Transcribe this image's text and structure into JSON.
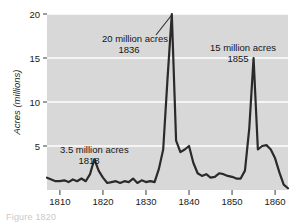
{
  "figure": {
    "background_color": "#ffffff",
    "plot_background_color": "#d8d8d8",
    "gridline_color": "#ffffff",
    "line_color": "#2a2a2a",
    "text_color": "#141414",
    "caption_fragment": "Figure    1820"
  },
  "chart_data": {
    "type": "line",
    "title": "",
    "subtitle": "",
    "xlabel": "",
    "ylabel": "Acres (millions)",
    "xlim": [
      1807,
      1863
    ],
    "ylim": [
      0,
      20
    ],
    "xticks": [
      1810,
      1820,
      1830,
      1840,
      1850,
      1860
    ],
    "yticks": [
      5,
      10,
      15,
      20
    ],
    "xtick_labels": [
      "1810",
      "1820",
      "1830",
      "1840",
      "1850",
      "1860"
    ],
    "ytick_labels": [
      "5",
      "10",
      "15",
      "20"
    ],
    "grid": true,
    "grid_axis": "y",
    "legend": false,
    "legend_position": "none",
    "series": [
      {
        "name": "Public land sales",
        "x": [
          1807,
          1808,
          1809,
          1810,
          1811,
          1812,
          1813,
          1814,
          1815,
          1816,
          1817,
          1818,
          1819,
          1820,
          1821,
          1822,
          1823,
          1824,
          1825,
          1826,
          1827,
          1828,
          1829,
          1830,
          1831,
          1832,
          1833,
          1834,
          1835,
          1836,
          1837,
          1838,
          1839,
          1840,
          1841,
          1842,
          1843,
          1844,
          1845,
          1846,
          1847,
          1848,
          1849,
          1850,
          1851,
          1852,
          1853,
          1854,
          1855,
          1856,
          1857,
          1858,
          1859,
          1860,
          1861,
          1862,
          1863
        ],
        "values": [
          1.4,
          1.2,
          1.0,
          1.0,
          1.1,
          0.9,
          1.2,
          1.0,
          1.3,
          1.0,
          1.8,
          3.5,
          2.2,
          1.4,
          0.8,
          0.9,
          1.0,
          0.8,
          1.0,
          0.9,
          1.3,
          0.8,
          1.1,
          0.9,
          1.0,
          0.9,
          2.4,
          4.6,
          12.6,
          20.0,
          5.6,
          4.3,
          4.6,
          5.0,
          3.1,
          1.9,
          1.6,
          1.8,
          1.4,
          1.5,
          1.9,
          1.8,
          1.6,
          1.5,
          1.3,
          1.3,
          2.2,
          7.0,
          15.0,
          4.6,
          5.0,
          5.1,
          4.6,
          3.6,
          2.0,
          0.6,
          0.2
        ]
      }
    ],
    "annotations": [
      {
        "id": "peak-1836",
        "line1": "20 million acres",
        "line2": "1836",
        "value": 20,
        "year": 1836,
        "leader_line": true
      },
      {
        "id": "peak-1855",
        "line1": "15 million acres",
        "line2": "1855",
        "value": 15,
        "year": 1855,
        "leader_line": false
      },
      {
        "id": "peak-1818",
        "line1": "3.5 million acres",
        "line2": "1818",
        "value": 3.5,
        "year": 1818,
        "leader_line": false
      }
    ]
  }
}
